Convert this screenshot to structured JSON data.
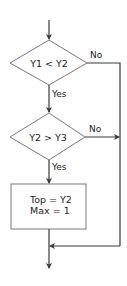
{
  "diagram": {
    "type": "flowchart",
    "nodes": [
      {
        "id": "decision1",
        "shape": "diamond",
        "text": "Y1 < Y2"
      },
      {
        "id": "decision2",
        "shape": "diamond",
        "text": "Y2 > Y3"
      },
      {
        "id": "process1",
        "shape": "rectangle",
        "lines": [
          "Top = Y2",
          "Max = 1"
        ]
      }
    ],
    "edges": [
      {
        "from": "start",
        "to": "decision1",
        "label": ""
      },
      {
        "from": "decision1",
        "to": "decision2",
        "label": "Yes"
      },
      {
        "from": "decision1",
        "to": "merge",
        "label": "No"
      },
      {
        "from": "decision2",
        "to": "process1",
        "label": "Yes"
      },
      {
        "from": "decision2",
        "to": "merge",
        "label": "No"
      },
      {
        "from": "process1",
        "to": "merge",
        "label": ""
      },
      {
        "from": "merge",
        "to": "end",
        "label": ""
      }
    ],
    "labels": {
      "d1_yes": "Yes",
      "d1_no": "No",
      "d2_yes": "Yes",
      "d2_no": "No"
    }
  }
}
